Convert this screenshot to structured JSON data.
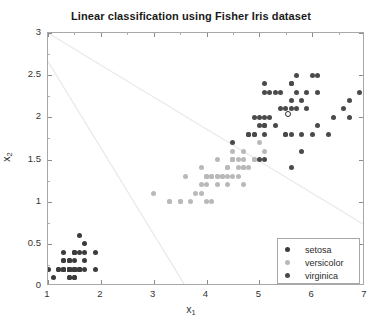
{
  "chart_data": {
    "type": "scatter",
    "title": "Linear classification using Fisher Iris dataset",
    "xlabel": "x_1",
    "ylabel": "x_2",
    "xlabel_base": "x",
    "xlabel_sub": "1",
    "ylabel_base": "x",
    "ylabel_sub": "2",
    "xlim": [
      1,
      7
    ],
    "ylim": [
      0,
      3
    ],
    "xticks": [
      1,
      2,
      3,
      4,
      5,
      6,
      7
    ],
    "yticks": [
      0,
      0.5,
      1,
      1.5,
      2,
      2.5,
      3
    ],
    "xticklabels": [
      "1",
      "2",
      "3",
      "4",
      "5",
      "6",
      "7"
    ],
    "yticklabels": [
      "0",
      "0.5",
      "1",
      "1.5",
      "2",
      "2.5",
      "3"
    ],
    "grid": false,
    "legend_position": "lower right",
    "legend": [
      {
        "name": "setosa",
        "color": "#3b3b3b"
      },
      {
        "name": "versicolor",
        "color": "#b9b9b9"
      },
      {
        "name": "virginica",
        "color": "#4a4a4a"
      }
    ],
    "series": [
      {
        "name": "setosa",
        "color": "#3b3b3b",
        "points": [
          [
            1.4,
            0.2
          ],
          [
            1.4,
            0.2
          ],
          [
            1.3,
            0.2
          ],
          [
            1.5,
            0.2
          ],
          [
            1.4,
            0.2
          ],
          [
            1.7,
            0.4
          ],
          [
            1.4,
            0.3
          ],
          [
            1.5,
            0.2
          ],
          [
            1.4,
            0.2
          ],
          [
            1.5,
            0.1
          ],
          [
            1.5,
            0.2
          ],
          [
            1.6,
            0.2
          ],
          [
            1.4,
            0.1
          ],
          [
            1.1,
            0.1
          ],
          [
            1.2,
            0.2
          ],
          [
            1.5,
            0.4
          ],
          [
            1.3,
            0.4
          ],
          [
            1.4,
            0.3
          ],
          [
            1.7,
            0.3
          ],
          [
            1.5,
            0.3
          ],
          [
            1.7,
            0.2
          ],
          [
            1.5,
            0.4
          ],
          [
            1.0,
            0.2
          ],
          [
            1.7,
            0.5
          ],
          [
            1.9,
            0.2
          ],
          [
            1.6,
            0.2
          ],
          [
            1.6,
            0.4
          ],
          [
            1.5,
            0.2
          ],
          [
            1.4,
            0.2
          ],
          [
            1.6,
            0.2
          ],
          [
            1.6,
            0.2
          ],
          [
            1.5,
            0.4
          ],
          [
            1.5,
            0.1
          ],
          [
            1.4,
            0.2
          ],
          [
            1.5,
            0.2
          ],
          [
            1.2,
            0.2
          ],
          [
            1.3,
            0.2
          ],
          [
            1.4,
            0.1
          ],
          [
            1.3,
            0.2
          ],
          [
            1.5,
            0.2
          ],
          [
            1.3,
            0.3
          ],
          [
            1.3,
            0.3
          ],
          [
            1.3,
            0.2
          ],
          [
            1.6,
            0.6
          ],
          [
            1.9,
            0.4
          ],
          [
            1.4,
            0.3
          ],
          [
            1.6,
            0.2
          ],
          [
            1.4,
            0.2
          ],
          [
            1.5,
            0.2
          ],
          [
            1.4,
            0.2
          ]
        ]
      },
      {
        "name": "versicolor",
        "color": "#b9b9b9",
        "points": [
          [
            4.7,
            1.4
          ],
          [
            4.5,
            1.5
          ],
          [
            4.9,
            1.5
          ],
          [
            4.0,
            1.3
          ],
          [
            4.6,
            1.5
          ],
          [
            4.5,
            1.3
          ],
          [
            4.7,
            1.6
          ],
          [
            3.3,
            1.0
          ],
          [
            4.6,
            1.3
          ],
          [
            3.9,
            1.4
          ],
          [
            3.5,
            1.0
          ],
          [
            4.2,
            1.5
          ],
          [
            4.0,
            1.0
          ],
          [
            4.7,
            1.4
          ],
          [
            3.6,
            1.3
          ],
          [
            4.4,
            1.4
          ],
          [
            4.5,
            1.5
          ],
          [
            4.1,
            1.0
          ],
          [
            4.5,
            1.5
          ],
          [
            3.9,
            1.1
          ],
          [
            4.8,
            1.8
          ],
          [
            4.0,
            1.3
          ],
          [
            4.9,
            1.5
          ],
          [
            4.7,
            1.2
          ],
          [
            4.3,
            1.3
          ],
          [
            4.4,
            1.4
          ],
          [
            4.8,
            1.4
          ],
          [
            5.0,
            1.7
          ],
          [
            4.5,
            1.5
          ],
          [
            3.5,
            1.0
          ],
          [
            3.8,
            1.1
          ],
          [
            3.7,
            1.0
          ],
          [
            3.9,
            1.2
          ],
          [
            5.1,
            1.6
          ],
          [
            4.5,
            1.5
          ],
          [
            4.5,
            1.6
          ],
          [
            4.7,
            1.5
          ],
          [
            4.4,
            1.3
          ],
          [
            4.1,
            1.3
          ],
          [
            4.0,
            1.3
          ],
          [
            4.4,
            1.2
          ],
          [
            4.6,
            1.4
          ],
          [
            4.0,
            1.2
          ],
          [
            3.3,
            1.0
          ],
          [
            4.2,
            1.3
          ],
          [
            4.2,
            1.2
          ],
          [
            4.2,
            1.3
          ],
          [
            4.3,
            1.3
          ],
          [
            3.0,
            1.1
          ],
          [
            4.1,
            1.3
          ]
        ]
      },
      {
        "name": "virginica",
        "color": "#4a4a4a",
        "points": [
          [
            6.0,
            2.5
          ],
          [
            5.1,
            1.9
          ],
          [
            5.9,
            2.1
          ],
          [
            5.6,
            1.8
          ],
          [
            5.8,
            2.2
          ],
          [
            6.6,
            2.1
          ],
          [
            4.5,
            1.7
          ],
          [
            6.3,
            1.8
          ],
          [
            5.8,
            1.8
          ],
          [
            6.1,
            2.5
          ],
          [
            5.1,
            2.0
          ],
          [
            5.3,
            1.9
          ],
          [
            5.5,
            2.1
          ],
          [
            5.0,
            2.0
          ],
          [
            5.1,
            2.4
          ],
          [
            5.3,
            2.3
          ],
          [
            5.5,
            1.8
          ],
          [
            6.7,
            2.2
          ],
          [
            6.9,
            2.3
          ],
          [
            5.0,
            1.5
          ],
          [
            5.7,
            2.3
          ],
          [
            4.9,
            2.0
          ],
          [
            6.7,
            2.0
          ],
          [
            4.9,
            1.8
          ],
          [
            5.7,
            2.1
          ],
          [
            6.0,
            1.8
          ],
          [
            4.8,
            1.8
          ],
          [
            4.9,
            1.8
          ],
          [
            5.6,
            2.1
          ],
          [
            5.8,
            1.6
          ],
          [
            6.1,
            1.9
          ],
          [
            6.4,
            2.0
          ],
          [
            5.6,
            2.2
          ],
          [
            5.1,
            1.5
          ],
          [
            5.6,
            1.4
          ],
          [
            6.1,
            2.3
          ],
          [
            5.6,
            2.4
          ],
          [
            5.5,
            1.8
          ],
          [
            4.8,
            1.8
          ],
          [
            5.4,
            2.1
          ],
          [
            5.6,
            2.4
          ],
          [
            5.1,
            2.3
          ],
          [
            5.1,
            1.9
          ],
          [
            5.9,
            2.3
          ],
          [
            5.7,
            2.5
          ],
          [
            5.2,
            2.3
          ],
          [
            5.0,
            1.9
          ],
          [
            5.2,
            2.0
          ],
          [
            5.4,
            2.3
          ],
          [
            5.1,
            1.8
          ]
        ]
      }
    ],
    "highlighted_point": {
      "name": "query-point",
      "x": 5.55,
      "y": 2.03,
      "marker": "open-circle"
    },
    "decision_boundaries": [
      {
        "name": "boundary-setosa-versicolor",
        "x1": 1.0,
        "y1": 2.66,
        "x2": 3.6,
        "y2": 0.0,
        "color": "#e8e8e8"
      },
      {
        "name": "boundary-versicolor-virginica",
        "x1": 1.0,
        "y1": 3.0,
        "x2": 7.0,
        "y2": 0.72,
        "color": "#eaeaea"
      }
    ]
  }
}
